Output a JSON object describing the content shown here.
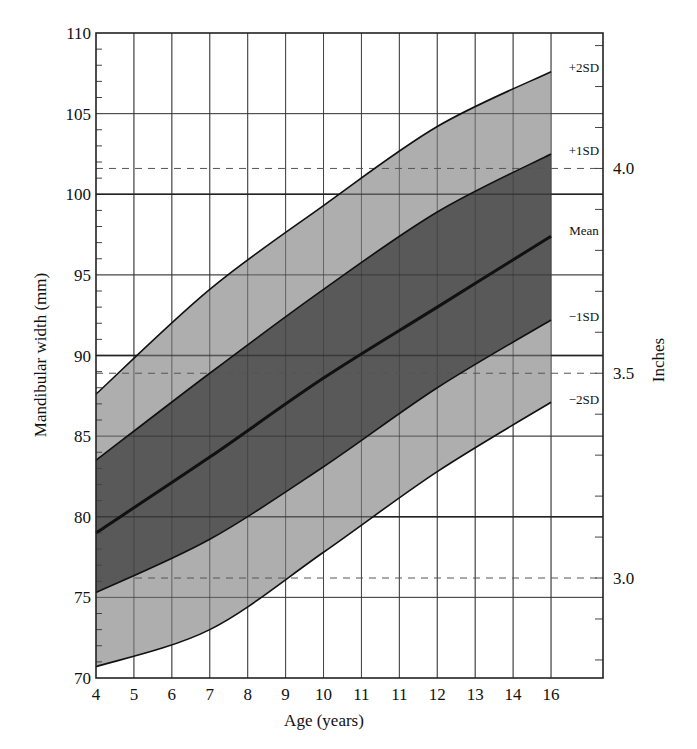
{
  "chart_data": {
    "type": "area",
    "title": "",
    "xlabel": "Age (years)",
    "ylabel": "Mandibular width (mm)",
    "y2label": "Inches",
    "xlim": [
      4,
      16
    ],
    "ylim": [
      70,
      110
    ],
    "x_tick_labels": [
      "4",
      "5",
      "6",
      "7",
      "8",
      "9",
      "10",
      "11",
      "11",
      "12",
      "13",
      "14",
      "16"
    ],
    "y_tick_labels": [
      "70",
      "75",
      "80",
      "85",
      "90",
      "95",
      "100",
      "105",
      "110"
    ],
    "y_ticks": [
      70,
      75,
      80,
      85,
      90,
      95,
      100,
      105,
      110
    ],
    "y2_ticks": [
      {
        "label": "3.0",
        "mm": 76.2
      },
      {
        "label": "3.5",
        "mm": 88.9
      },
      {
        "label": "4.0",
        "mm": 101.6
      }
    ],
    "grid": true,
    "x": [
      4,
      7,
      10,
      13,
      16
    ],
    "series": [
      {
        "name": "+2SD",
        "values": [
          87.6,
          94.1,
          99.3,
          104.2,
          107.6
        ]
      },
      {
        "name": "+1SD",
        "values": [
          83.5,
          88.9,
          94.1,
          98.9,
          102.5
        ]
      },
      {
        "name": "Mean",
        "values": [
          79.0,
          83.7,
          88.6,
          93.0,
          97.4
        ]
      },
      {
        "name": "−1SD",
        "values": [
          75.3,
          78.6,
          83.1,
          88.0,
          92.2
        ]
      },
      {
        "name": "−2SD",
        "values": [
          70.7,
          73.0,
          77.8,
          82.8,
          87.1
        ]
      }
    ],
    "bands": [
      {
        "from": "−2SD",
        "to": "+2SD",
        "color": "#a3a3a3"
      },
      {
        "from": "−1SD",
        "to": "+1SD",
        "color": "#4d4d4d"
      }
    ],
    "legend_position": "right-inline"
  },
  "labels": {
    "xlabel": "Age (years)",
    "ylabel": "Mandibular width (mm)",
    "y2label": "Inches",
    "plus2sd": "+2SD",
    "plus1sd": "+1SD",
    "mean": "Mean",
    "minus1sd": "−1SD",
    "minus2sd": "−2SD"
  }
}
